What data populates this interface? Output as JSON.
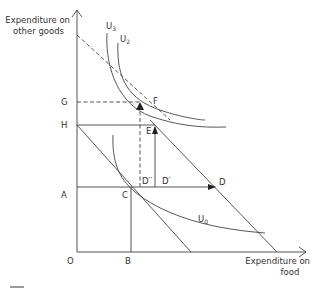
{
  "diagram": {
    "type": "indifference-curve budget diagram",
    "y_axis_label": [
      "Expenditure on",
      "other goods"
    ],
    "x_axis_label": [
      "Expenditure on",
      "food"
    ],
    "origin_label": "O",
    "axis_point_labels": {
      "G": "G",
      "H": "H",
      "A": "A",
      "B": "B"
    },
    "point_labels": {
      "C": "C",
      "D": "D",
      "D_prime": "D′",
      "D_double_prime": "D′′",
      "E": "E",
      "F": "F"
    },
    "curves": {
      "U0": {
        "name": "U",
        "sub": "0"
      },
      "U2": {
        "name": "U",
        "sub": "2"
      },
      "U3": {
        "name": "U",
        "sub": "3"
      }
    },
    "colors": {
      "ink": "#444444",
      "text": "#333333",
      "footer_bar": "#9a9a9a"
    }
  }
}
